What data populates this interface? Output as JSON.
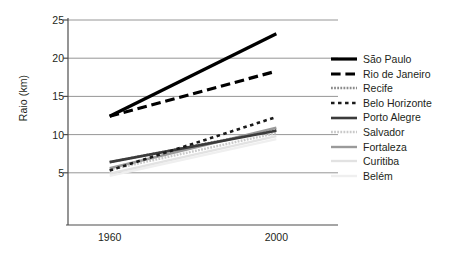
{
  "chart_data": {
    "type": "line",
    "title": "",
    "xlabel": "",
    "ylabel": "Raio (km)",
    "x": [
      1960,
      2000
    ],
    "xtick_labels": [
      "1960",
      "2000"
    ],
    "ytick_labels": [
      "5",
      "10",
      "15",
      "20",
      "25"
    ],
    "yticks": [
      5,
      10,
      15,
      20,
      25
    ],
    "ylim": [
      0,
      25
    ],
    "xlim": [
      1950,
      2010
    ],
    "grid": "horizontal",
    "legend_position": "right",
    "series": [
      {
        "name": "São Paulo",
        "values": [
          12.4,
          23.2
        ],
        "color": "#000000",
        "style": "solid",
        "width": 3.2
      },
      {
        "name": "Rio de Janeiro",
        "values": [
          12.4,
          18.3
        ],
        "color": "#000000",
        "style": "dashed",
        "width": 3.2
      },
      {
        "name": "Recife",
        "values": [
          6.4,
          10.6
        ],
        "color": "#8c8c8c",
        "style": "fine-dotted",
        "width": 2.4
      },
      {
        "name": "Belo Horizonte",
        "values": [
          5.3,
          12.3
        ],
        "color": "#1a1a1a",
        "style": "dotted",
        "width": 2.6
      },
      {
        "name": "Porto Alegre",
        "values": [
          6.4,
          10.5
        ],
        "color": "#3b3b3b",
        "style": "solid",
        "width": 2.6
      },
      {
        "name": "Salvador",
        "values": [
          5.4,
          10.2
        ],
        "color": "#c9c9c9",
        "style": "fine-dotted",
        "width": 2.4
      },
      {
        "name": "Fortaleza",
        "values": [
          5.6,
          10.9
        ],
        "color": "#9a9a9a",
        "style": "solid",
        "width": 2.4
      },
      {
        "name": "Curitiba",
        "values": [
          4.9,
          9.8
        ],
        "color": "#e2e2e2",
        "style": "solid",
        "width": 2.4
      },
      {
        "name": "Belém",
        "values": [
          4.6,
          9.4
        ],
        "color": "#efefef",
        "style": "solid",
        "width": 2.4
      }
    ]
  },
  "axis": {
    "y_title": "Raio (km)"
  },
  "colors": {
    "axis": "#4d4d4d",
    "grid": "#8a8a8a",
    "text": "#231f20",
    "background": "#ffffff"
  }
}
